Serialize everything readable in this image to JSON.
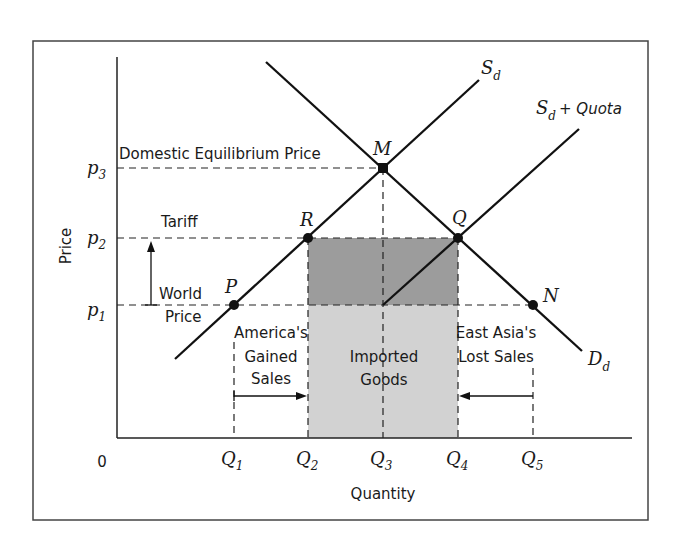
{
  "diagram": {
    "axis_labels": {
      "y": "Price",
      "x": "Quantity",
      "origin": "0"
    },
    "price_ticks": [
      {
        "name": "p",
        "sub": "3"
      },
      {
        "name": "p",
        "sub": "2"
      },
      {
        "name": "p",
        "sub": "1"
      }
    ],
    "quantity_ticks": [
      {
        "name": "Q",
        "sub": "1"
      },
      {
        "name": "Q",
        "sub": "2"
      },
      {
        "name": "Q",
        "sub": "3"
      },
      {
        "name": "Q",
        "sub": "4"
      },
      {
        "name": "Q",
        "sub": "5"
      }
    ],
    "curves": {
      "supply": {
        "name": "S",
        "sub": "d"
      },
      "supply_quota": {
        "name": "S",
        "sub": "d",
        "suffix": "+ Quota"
      },
      "demand": {
        "name": "D",
        "sub": "d"
      }
    },
    "points": {
      "M": "M",
      "R": "R",
      "Q": "Q",
      "P": "P",
      "N": "N"
    },
    "annotations": {
      "domestic_eq": "Domestic Equilibrium Price",
      "tariff": "Tariff",
      "world_line1": "World",
      "world_line2": "Price",
      "america_line1": "America's",
      "america_line2": "Gained",
      "america_line3": "Sales",
      "imported_line1": "Imported",
      "imported_line2": "Goods",
      "eastasia_line1": "East Asia's",
      "eastasia_line2": "Lost Sales"
    },
    "colors": {
      "line": "#111111",
      "tariff_rect": "#9c9c9c",
      "imports_rect": "#d2d2d2",
      "frame": "#444444"
    }
  }
}
